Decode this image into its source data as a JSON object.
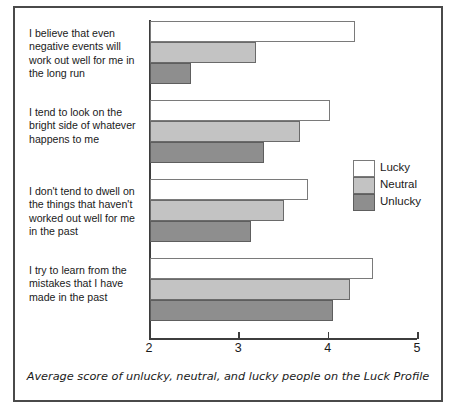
{
  "figure": {
    "caption": "Average score of unlucky, neutral, and lucky people on the Luck Profile",
    "frame_color": "#4a4a4a"
  },
  "legend": {
    "position": "middle-right",
    "entries": [
      {
        "label": "Lucky",
        "color": "#ffffff",
        "key": "lucky"
      },
      {
        "label": "Neutral",
        "color": "#c3c3c3",
        "key": "neutral"
      },
      {
        "label": "Unlucky",
        "color": "#8e8e8e",
        "key": "unlucky"
      }
    ]
  },
  "axis": {
    "ticks": [
      "2",
      "3",
      "4",
      "5"
    ],
    "min": 2,
    "max": 5
  },
  "chart_data": {
    "type": "bar",
    "orientation": "horizontal",
    "title": "",
    "subtitle": "",
    "xlabel": "",
    "ylabel": "",
    "xlim": [
      2,
      5
    ],
    "xticks": [
      2,
      3,
      4,
      5
    ],
    "grid": false,
    "legend_position": "middle-right",
    "categories": [
      "I believe that even negative events will work out well for me in the long run",
      "I tend to look on the bright side of whatever happens to me",
      "I don't tend to dwell on the things that haven't worked out well for me in the past",
      "I try to learn from the mistakes that I have made in the past"
    ],
    "series": [
      {
        "name": "Lucky",
        "color": "#ffffff",
        "values": [
          4.3,
          4.02,
          3.77,
          4.5
        ]
      },
      {
        "name": "Neutral",
        "color": "#c3c3c3",
        "values": [
          3.19,
          3.68,
          3.5,
          4.24
        ]
      },
      {
        "name": "Unlucky",
        "color": "#8e8e8e",
        "values": [
          2.46,
          3.28,
          3.13,
          4.05
        ]
      }
    ]
  }
}
